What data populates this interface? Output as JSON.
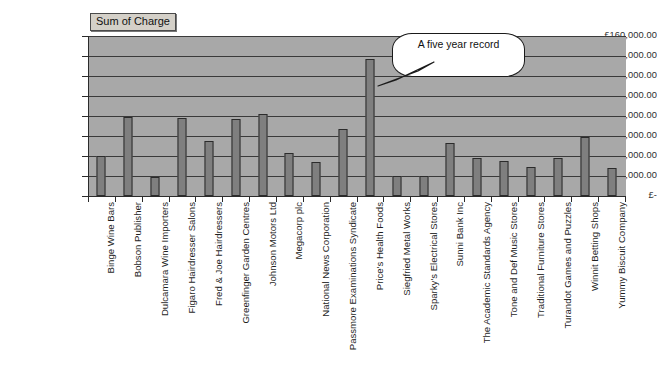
{
  "legend": {
    "label": "Sum of Charge"
  },
  "annotation": {
    "text": "A five year record"
  },
  "chart_data": {
    "type": "bar",
    "title": "",
    "subtitle": "",
    "xlabel": "",
    "ylabel": "",
    "ylim": [
      0,
      160000
    ],
    "grid": true,
    "legend_position": "top-left",
    "currency_symbol": "£",
    "ytick_labels": [
      "£160,000.00",
      "£140,000.00",
      "£120,000.00",
      "£100,000.00",
      "£80,000.00",
      "£60,000.00",
      "£40,000.00",
      "£20,000.00",
      "£-"
    ],
    "ytick_values": [
      160000,
      140000,
      120000,
      100000,
      80000,
      60000,
      40000,
      20000,
      0
    ],
    "series_name": "Sum of Charge",
    "categories": [
      "Binge Wine Bars",
      "Bobson Publisher",
      "Dulcamara Wine Importers",
      "Figaro Hairdresser Salons",
      "Fred & Joe Hairdressers",
      "Greenfinger Garden Centres",
      "Johnson Motors Ltd",
      "Megacorp plc",
      "National News Corporation",
      "Passmore Examinations Syndicate",
      "Price's Health Foods",
      "Siegfried Metal Works",
      "Sparky's Electrical Stores",
      "Sunni Bank Inc",
      "The Academic Standards Agency",
      "Tone and Def Music Stores",
      "Traditional Furniture Stores",
      "Turandot Games and Puzzles",
      "Winnit Betting Shops",
      "Yummy Biscuit Company"
    ],
    "values": [
      40000,
      79000,
      19000,
      78000,
      55000,
      77000,
      82000,
      43000,
      34000,
      67000,
      137000,
      20000,
      20000,
      53000,
      38000,
      35000,
      29000,
      38000,
      59000,
      28000
    ],
    "annotations": [
      {
        "text": "A five year record",
        "target_category": "Price's Health Foods"
      }
    ]
  },
  "colors": {
    "plot_background": "#a8a8a8",
    "bar_fill": "#7f7f7f",
    "bar_border": "#2b2b2b",
    "gridline": "#3a3a3a",
    "page_background": "#ffffff",
    "legend_background": "#d4d0c8",
    "callout_background": "#ffffff"
  }
}
